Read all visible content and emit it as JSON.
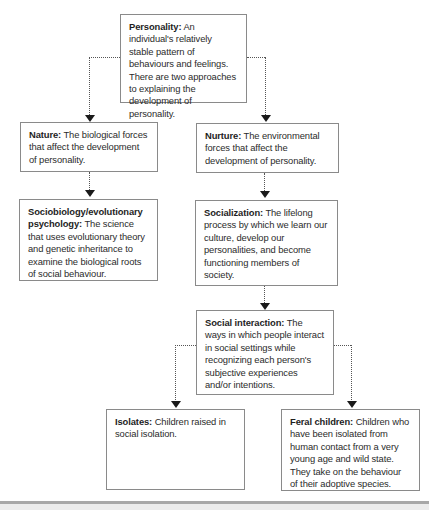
{
  "diagram": {
    "nodes": {
      "personality": {
        "term": "Personality:",
        "definition": "An individual's relatively stable pattern of behaviours and feelings. There are two approaches to explaining the development of personality."
      },
      "nature": {
        "term": "Nature:",
        "definition": "The biological forces that affect the development of personality."
      },
      "nurture": {
        "term": "Nurture:",
        "definition": "The environmental forces that affect the development of personality."
      },
      "sociobiology": {
        "term": "Sociobiology/evolutionary psychology:",
        "definition": "The science that uses evolutionary theory and genetic inheritance to examine the biological roots of social behaviour."
      },
      "socialization": {
        "term": "Socialization:",
        "definition": "The lifelong process by which we learn our culture, develop our personalities, and become functioning members of society."
      },
      "social_interaction": {
        "term": "Social interaction:",
        "definition": "The ways in which people interact in social settings while recognizing each person's subjective experiences and/or intentions."
      },
      "isolates": {
        "term": "Isolates:",
        "definition": "Children raised in social isolation."
      },
      "feral_children": {
        "term": "Feral children:",
        "definition": "Children who have been isolated from human contact from a very young age and wild state. They take on the behaviour of their adoptive species."
      }
    },
    "edges": [
      {
        "from": "personality",
        "to": "nature"
      },
      {
        "from": "personality",
        "to": "nurture"
      },
      {
        "from": "nature",
        "to": "sociobiology"
      },
      {
        "from": "nurture",
        "to": "socialization"
      },
      {
        "from": "socialization",
        "to": "social_interaction"
      },
      {
        "from": "social_interaction",
        "to": "isolates"
      },
      {
        "from": "social_interaction",
        "to": "feral_children"
      }
    ],
    "colors": {
      "box_border": "#8a8a8a",
      "connector": "#555555",
      "arrowhead": "#1a1a1a",
      "text": "#2b2b2b"
    }
  }
}
